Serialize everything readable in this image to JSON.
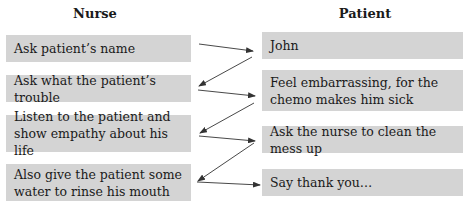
{
  "columns": {
    "nurse": {
      "title": "Nurse",
      "items": [
        "Ask patient’s name",
        "Ask what the patient’s trouble",
        "Listen to the patient and show empathy about his life",
        "Also give the patient some water to rinse his mouth"
      ]
    },
    "patient": {
      "title": "Patient",
      "items": [
        "John",
        "Feel embarrassing, for the chemo makes him sick",
        "Ask the nurse to clean the mess up",
        "Say thank you…"
      ]
    }
  },
  "connections": [
    {
      "from": "nurse.0",
      "to": "patient.0"
    },
    {
      "from": "patient.0",
      "to": "nurse.1"
    },
    {
      "from": "nurse.1",
      "to": "patient.1"
    },
    {
      "from": "patient.1",
      "to": "nurse.2"
    },
    {
      "from": "nurse.2",
      "to": "patient.2"
    },
    {
      "from": "patient.2",
      "to": "nurse.3"
    },
    {
      "from": "nurse.3",
      "to": "patient.3"
    }
  ],
  "colors": {
    "box_fill": "#d4d4d4",
    "arrow": "#333333"
  }
}
